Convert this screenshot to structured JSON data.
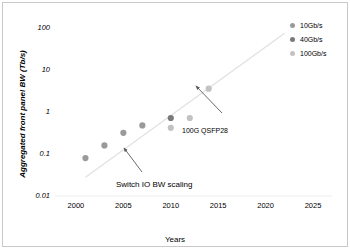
{
  "chart_data": {
    "type": "scatter",
    "title": "",
    "xlabel": "Years",
    "ylabel": "Aggregated front panel BW (Tb/s)",
    "xlim": [
      1998,
      2027
    ],
    "ylim": [
      0.01,
      100
    ],
    "yscale": "log",
    "xscale": "linear",
    "grid": false,
    "legend_position": "top-right",
    "xticks": [
      "2000",
      "2005",
      "2010",
      "2015",
      "2020",
      "2025"
    ],
    "xtick_values": [
      2000,
      2005,
      2010,
      2015,
      2020,
      2025
    ],
    "yticks": [
      "0.01",
      "0.1",
      "1",
      "10",
      "100"
    ],
    "ytick_values": [
      0.01,
      0.1,
      1,
      10,
      100
    ],
    "series": [
      {
        "name": "10Gb/s",
        "color": "#9a9a9a",
        "points": [
          {
            "x": 2001,
            "y": 0.08
          },
          {
            "x": 2003,
            "y": 0.16
          },
          {
            "x": 2005,
            "y": 0.32
          },
          {
            "x": 2007,
            "y": 0.48
          }
        ]
      },
      {
        "name": "40Gb/s",
        "color": "#7a7a7a",
        "points": [
          {
            "x": 2010,
            "y": 0.72
          }
        ]
      },
      {
        "name": "100Gb/s",
        "color": "#c2c2c2",
        "points": [
          {
            "x": 2010,
            "y": 0.42
          },
          {
            "x": 2012,
            "y": 0.72
          },
          {
            "x": 2014,
            "y": 3.6
          }
        ]
      }
    ],
    "trendline": {
      "label": "Switch IO BW scaling",
      "color": "#e2e2e2",
      "x_start": 2001,
      "y_start": 0.028,
      "x_end": 2022,
      "y_end": 75
    },
    "annotations": [
      {
        "text": "100G QSFP28",
        "target_x": 2014,
        "target_y": 3.6
      },
      {
        "text": "Switch IO BW scaling",
        "target_x": 2009,
        "target_y": 0.22
      }
    ]
  },
  "legend": {
    "items": [
      {
        "label": "10Gb/s",
        "color": "#9a9a9a"
      },
      {
        "label": "40Gb/s",
        "color": "#7a7a7a"
      },
      {
        "label": "100Gb/s",
        "color": "#c2c2c2"
      }
    ]
  },
  "axes": {
    "y_title": "Aggregated front panel BW (Tb/s)",
    "x_title": "Years",
    "y_labels": [
      "100",
      "10",
      "1",
      "0.1",
      "0.01"
    ],
    "x_labels": [
      "2000",
      "2005",
      "2010",
      "2015",
      "2020",
      "2025"
    ]
  },
  "annotations": {
    "qsfp": "100G QSFP28",
    "trend": "Switch IO BW scaling"
  }
}
